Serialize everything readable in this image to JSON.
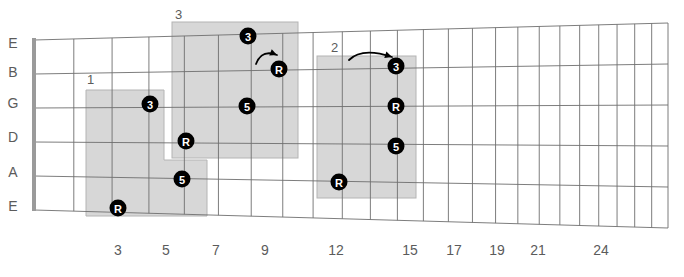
{
  "diagram": {
    "type": "fretboard",
    "colors": {
      "box_fill": "#d5d5d5",
      "box_stroke": "#b4b4b4",
      "fret_line": "#6e6e6e",
      "string_line": "#6e6e6e",
      "nut": "#9a9a9a",
      "marker_fill": "#000000",
      "marker_text": "#ffffff",
      "label_text": "#5b5b5b"
    }
  },
  "strings": {
    "labels": [
      "E",
      "B",
      "G",
      "D",
      "A",
      "E"
    ],
    "y": [
      43,
      72,
      103,
      137,
      172,
      206
    ],
    "label_x": 13
  },
  "frets": {
    "labels": [
      "3",
      "5",
      "7",
      "9",
      "12",
      "15",
      "17",
      "19",
      "21",
      "24"
    ],
    "label_y": 255,
    "label_x": [
      118,
      166,
      216,
      265,
      336,
      410,
      454,
      497,
      538,
      601
    ],
    "count": 24
  },
  "boxes": [
    {
      "label": "1",
      "label_x": 87,
      "label_y": 84,
      "shape": "stepped",
      "x1": 86,
      "y1": 90,
      "x2": 164,
      "y2": 160,
      "x3": 207,
      "y3": 216,
      "x4": 86,
      "y4": 216
    },
    {
      "label": "3",
      "label_x": 175,
      "label_y": 19,
      "shape": "rect",
      "x": 172,
      "y": 22,
      "w": 126,
      "h": 136
    },
    {
      "label": "2",
      "label_x": 331,
      "label_y": 52,
      "shape": "rect",
      "x": 317,
      "y": 56,
      "w": 99,
      "h": 142
    }
  ],
  "markers": [
    {
      "text": "3",
      "x": 248,
      "y": 36,
      "box": "3"
    },
    {
      "text": "R",
      "x": 279,
      "y": 69,
      "box": "3"
    },
    {
      "text": "5",
      "x": 247,
      "y": 106,
      "box": "3"
    },
    {
      "text": "R",
      "x": 186,
      "y": 141,
      "box": "3"
    },
    {
      "text": "3",
      "x": 150,
      "y": 104,
      "box": "1"
    },
    {
      "text": "5",
      "x": 182,
      "y": 179,
      "box": "1"
    },
    {
      "text": "R",
      "x": 118,
      "y": 208,
      "box": "1"
    },
    {
      "text": "3",
      "x": 396,
      "y": 66,
      "box": "2"
    },
    {
      "text": "R",
      "x": 396,
      "y": 106,
      "box": "2"
    },
    {
      "text": "5",
      "x": 396,
      "y": 146,
      "box": "2"
    },
    {
      "text": "R",
      "x": 339,
      "y": 182,
      "box": "2"
    }
  ],
  "arrows": [
    {
      "name": "shift-arrow-box3",
      "from_x": 256,
      "from_y": 64,
      "to_x": 277,
      "to_y": 55,
      "ctrl_x": 262,
      "ctrl_y": 49
    },
    {
      "name": "shift-arrow-box2",
      "from_x": 349,
      "from_y": 60,
      "to_x": 392,
      "to_y": 57,
      "ctrl_x": 362,
      "ctrl_y": 47
    }
  ]
}
